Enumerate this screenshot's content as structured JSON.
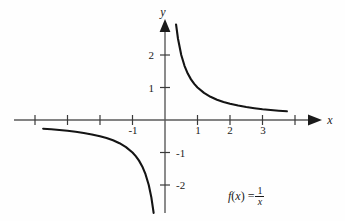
{
  "figure": {
    "title": "",
    "background_color": "#fefefe",
    "curve_color": "#141414",
    "axis_color": "#5a5a5a",
    "text_color": "#1a1a1a",
    "x_axis_label": "x",
    "y_axis_label": "y"
  },
  "formula": {
    "fn": "f",
    "open": "(",
    "var": "x",
    "close": ")",
    "equals": "=",
    "numerator": "1",
    "denominator": "x",
    "plain": "f(x) = 1/x"
  },
  "chart_data": {
    "type": "line",
    "title": "",
    "subtitle": "",
    "xlabel": "x",
    "ylabel": "y",
    "xlim": [
      -4.6,
      4.7
    ],
    "ylim": [
      -2.85,
      3.0
    ],
    "grid": false,
    "legend": null,
    "annotations": [
      "f(x) = 1/x"
    ],
    "xticks": [
      -4,
      -3,
      -2,
      -1,
      1,
      2,
      3,
      4
    ],
    "xtick_labels": [
      "",
      "",
      "",
      "-1",
      "1",
      "2",
      "3",
      ""
    ],
    "yticks": [
      2,
      1,
      -1,
      -2
    ],
    "ytick_labels": [
      "2",
      "1",
      "-1",
      "-2"
    ],
    "series": [
      {
        "name": "f(x) = 1/x (positive branch)",
        "x": [
          0.34,
          0.4,
          0.5,
          0.6,
          0.7,
          0.8,
          0.9,
          1.0,
          1.2,
          1.4,
          1.6,
          1.8,
          2.0,
          2.25,
          2.5,
          2.75,
          3.0,
          3.25,
          3.5,
          3.75
        ],
        "y": [
          2.94,
          2.5,
          2.0,
          1.667,
          1.429,
          1.25,
          1.111,
          1.0,
          0.833,
          0.714,
          0.625,
          0.556,
          0.5,
          0.444,
          0.4,
          0.364,
          0.333,
          0.308,
          0.286,
          0.267
        ]
      },
      {
        "name": "f(x) = 1/x (negative branch)",
        "x": [
          -3.75,
          -3.5,
          -3.25,
          -3.0,
          -2.75,
          -2.5,
          -2.25,
          -2.0,
          -1.8,
          -1.6,
          -1.4,
          -1.2,
          -1.0,
          -0.9,
          -0.8,
          -0.7,
          -0.6,
          -0.5,
          -0.42,
          -0.35
        ],
        "y": [
          -0.267,
          -0.286,
          -0.308,
          -0.333,
          -0.364,
          -0.4,
          -0.444,
          -0.5,
          -0.556,
          -0.625,
          -0.714,
          -0.833,
          -1.0,
          -1.111,
          -1.25,
          -1.429,
          -1.667,
          -2.0,
          -2.38,
          -2.86
        ]
      }
    ]
  }
}
